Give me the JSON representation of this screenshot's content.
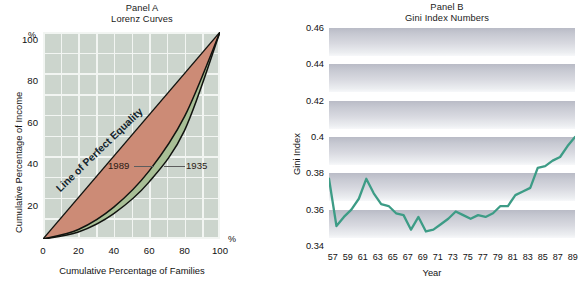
{
  "panelA": {
    "title_line1": "Panel A",
    "title_line2": "Lorenz Curves",
    "ylabel": "Cumulative Percentage of Income",
    "xlabel": "Cumulative Percentage of Families",
    "y_percent_symbol": "%",
    "x_percent_symbol": "%",
    "annotation_equality": "Line of Perfect Equality",
    "annotation_1989": "1989",
    "annotation_1935": "1935",
    "colors": {
      "plot_background": "#ccd5cd",
      "gridline": "#f2f5f2",
      "inequality_fill": "#cc8b76",
      "band_fill": "#a8bf96",
      "curve_stroke": "#11130f"
    }
  },
  "panelB": {
    "title_line1": "Panel B",
    "title_line2": "Gini Index Numbers",
    "ylabel": "Gini Index",
    "xlabel": "Year",
    "colors": {
      "line": "#3d9c86",
      "band_dark": "#b9bbc6",
      "band_light": "#f7f8fa"
    }
  },
  "chart_data": [
    {
      "type": "line",
      "title": "Panel A - Lorenz Curves",
      "xlabel": "Cumulative Percentage of Families",
      "ylabel": "Cumulative Percentage of Income",
      "xlim": [
        0,
        100
      ],
      "ylim": [
        0,
        100
      ],
      "xticks": [
        0,
        20,
        40,
        60,
        80,
        100
      ],
      "yticks": [
        20,
        40,
        60,
        80,
        100
      ],
      "grid": true,
      "legend": "inline-annotations",
      "annotations": [
        "Line of Perfect Equality",
        "1989",
        "1935"
      ],
      "x": [
        0,
        20,
        40,
        60,
        80,
        100
      ],
      "series": [
        {
          "name": "Line of Perfect Equality",
          "values": [
            0,
            20,
            40,
            60,
            80,
            100
          ]
        },
        {
          "name": "1989",
          "values": [
            0,
            4.6,
            15.4,
            32.9,
            59.2,
            100
          ]
        },
        {
          "name": "1935",
          "values": [
            0,
            3.4,
            12.3,
            27.6,
            52.5,
            100
          ]
        }
      ]
    },
    {
      "type": "line",
      "title": "Panel B - Gini Index Numbers",
      "xlabel": "Year",
      "ylabel": "Gini Index",
      "xlim": [
        1957,
        1990
      ],
      "ylim": [
        0.34,
        0.46
      ],
      "yticks": [
        0.34,
        0.36,
        0.38,
        0.4,
        0.42,
        0.44,
        0.46
      ],
      "ytick_labels": [
        "0.34",
        "0.36",
        "0.38",
        "0.4",
        "0.42",
        "0.44",
        "0.46"
      ],
      "xtick_labels": [
        "57",
        "59",
        "61",
        "63",
        "65",
        "67",
        "69",
        "71",
        "73",
        "75",
        "77",
        "79",
        "81",
        "83",
        "85",
        "87",
        "89"
      ],
      "grid": false,
      "x": [
        1957,
        1958,
        1959,
        1960,
        1961,
        1962,
        1963,
        1964,
        1965,
        1966,
        1967,
        1968,
        1969,
        1970,
        1971,
        1972,
        1973,
        1974,
        1975,
        1976,
        1977,
        1978,
        1979,
        1980,
        1981,
        1982,
        1983,
        1984,
        1985,
        1986,
        1987,
        1988,
        1989,
        1990
      ],
      "series": [
        {
          "name": "Gini Index",
          "values": [
            0.377,
            0.351,
            0.356,
            0.36,
            0.366,
            0.377,
            0.369,
            0.363,
            0.362,
            0.358,
            0.357,
            0.349,
            0.356,
            0.348,
            0.349,
            0.352,
            0.355,
            0.359,
            0.357,
            0.355,
            0.357,
            0.356,
            0.358,
            0.362,
            0.362,
            0.368,
            0.37,
            0.372,
            0.383,
            0.384,
            0.387,
            0.389,
            0.395,
            0.4
          ]
        }
      ]
    }
  ]
}
